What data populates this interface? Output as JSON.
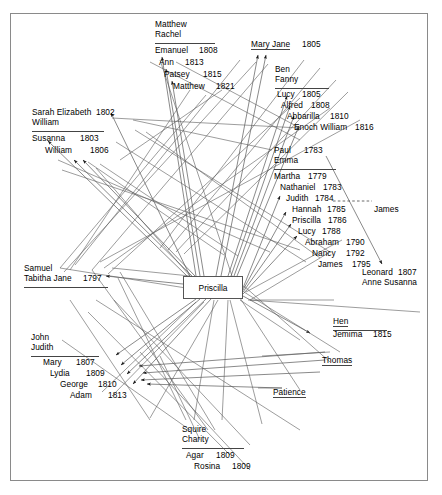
{
  "diagram": {
    "type": "genealogy-network",
    "title": "",
    "center_node": {
      "label": "Priscilla"
    },
    "frame": {
      "border_color": "#8a8a8a"
    },
    "families": [
      {
        "id": "matthew-rachel",
        "parents": [
          "Matthew",
          "Rachel"
        ],
        "children": [
          {
            "name": "Emanuel",
            "year": "1808"
          },
          {
            "name": "Ann",
            "year": "1813"
          },
          {
            "name": "Patsey",
            "year": "1815"
          },
          {
            "name": "Matthew",
            "year": "1821"
          }
        ]
      },
      {
        "id": "mary-jane",
        "parents": [],
        "children": [
          {
            "name": "Mary Jane",
            "year": "1805"
          }
        ]
      },
      {
        "id": "ben-fanny",
        "parents": [
          "Ben",
          "Fanny"
        ],
        "children": [
          {
            "name": "Lucy",
            "year": "1805"
          },
          {
            "name": "Alfred",
            "year": "1808"
          },
          {
            "name": "Abbarilla",
            "year": "1810"
          },
          {
            "name": "Enoch William",
            "year": "1816"
          }
        ]
      },
      {
        "id": "sarah-elizabeth-william",
        "parents": [
          "Sarah Elizabeth",
          "William"
        ],
        "parent_year": "1802",
        "children": [
          {
            "name": "Susanna",
            "year": "1803"
          },
          {
            "name": "William",
            "year": "1806"
          }
        ]
      },
      {
        "id": "paul-emma",
        "parents": [
          "Paul",
          "Emma"
        ],
        "parent_year": "1783",
        "children": [
          {
            "name": "Martha",
            "year": "1779"
          },
          {
            "name": "Nathaniel",
            "year": "1783"
          },
          {
            "name": "Judith",
            "year": "1784"
          },
          {
            "name": "Hannah",
            "year": "1785"
          },
          {
            "name": "Priscilla",
            "year": "1786"
          },
          {
            "name": "Lucy",
            "year": "1788"
          },
          {
            "name": "Abraham",
            "year": "1790"
          },
          {
            "name": "Nancy",
            "year": "1792"
          },
          {
            "name": "James",
            "year": "1795"
          }
        ]
      },
      {
        "id": "samuel-tabitha",
        "parents": [
          "Samuel",
          "Tabitha Jane"
        ],
        "parent_year": "1797",
        "children": []
      },
      {
        "id": "john-judith",
        "parents": [
          "John",
          "Judith"
        ],
        "children": [
          {
            "name": "Mary",
            "year": "1807"
          },
          {
            "name": "Lydia",
            "year": "1809"
          },
          {
            "name": "George",
            "year": "1810"
          },
          {
            "name": "Adam",
            "year": "1813"
          }
        ]
      },
      {
        "id": "squire-charity",
        "parents": [
          "Squire",
          "Charity"
        ],
        "children": [
          {
            "name": "Agar",
            "year": "1809"
          },
          {
            "name": "Rosina",
            "year": "1809"
          }
        ]
      },
      {
        "id": "hen-jemima",
        "parents": [
          "Hen"
        ],
        "children": [
          {
            "name": "Jemima",
            "year": "1815"
          }
        ]
      },
      {
        "id": "leonard-anne",
        "parents": [],
        "children": [
          {
            "name": "Leonard",
            "year": "1807"
          },
          {
            "name": "Anne Susanna",
            "year": ""
          }
        ]
      }
    ],
    "standalone_nodes": [
      {
        "id": "james-right",
        "label": "James"
      },
      {
        "id": "thomas",
        "label": "Thomas"
      },
      {
        "id": "patience",
        "label": "Patience"
      }
    ]
  },
  "labels": {
    "matthew": "Matthew",
    "rachel": "Rachel",
    "emanuel": "Emanuel",
    "emanuel_yr": "1808",
    "ann": "Ann",
    "ann_yr": "1813",
    "patsey": "Patsey",
    "patsey_yr": "1815",
    "matthew2": "Matthew",
    "matthew2_yr": "1821",
    "mary_jane": "Mary Jane",
    "mary_jane_yr": "1805",
    "ben": "Ben",
    "fanny": "Fanny",
    "lucy1": "Lucy",
    "lucy1_yr": "1805",
    "alfred": "Alfred",
    "alfred_yr": "1808",
    "abbarilla": "Abbarilla",
    "abbarilla_yr": "1810",
    "enoch": "Enoch William",
    "enoch_yr": "1816",
    "sarah_elizabeth": "Sarah Elizabeth",
    "sarah_yr": "1802",
    "william_p": "William",
    "susanna": "Susanna",
    "susanna_yr": "1803",
    "william_c": "William",
    "william_c_yr": "1806",
    "paul": "Paul",
    "paul_yr": "1783",
    "emma": "Emma",
    "martha": "Martha",
    "martha_yr": "1779",
    "nathaniel": "Nathaniel",
    "nathaniel_yr": "1783",
    "judith_c": "Judith",
    "judith_c_yr": "1784",
    "hannah": "Hannah",
    "hannah_yr": "1785",
    "priscilla_c": "Priscilla",
    "priscilla_c_yr": "1786",
    "lucy2": "Lucy",
    "lucy2_yr": "1788",
    "abraham": "Abraham",
    "abraham_yr": "1790",
    "nancy": "Nancy",
    "nancy_yr": "1792",
    "james_c": "James",
    "james_c_yr": "1795",
    "james_right": "James",
    "leonard": "Leonard",
    "leonard_yr": "1807",
    "anne_susanna": "Anne Susanna",
    "samuel": "Samuel",
    "tabitha": "Tabitha Jane",
    "tabitha_yr": "1797",
    "priscilla_box": "Priscilla",
    "john": "John",
    "judith_p": "Judith",
    "mary": "Mary",
    "mary_yr": "1807",
    "lydia": "Lydia",
    "lydia_yr": "1809",
    "george": "George",
    "george_yr": "1810",
    "adam": "Adam",
    "adam_yr": "1813",
    "hen": "Hen",
    "jemima": "Jemima",
    "jemima_yr": "1815",
    "thomas": "Thomas",
    "patience": "Patience",
    "squire": "Squire",
    "charity": "Charity",
    "agar": "Agar",
    "agar_yr": "1809",
    "rosina": "Rosina",
    "rosina_yr": "1809"
  }
}
